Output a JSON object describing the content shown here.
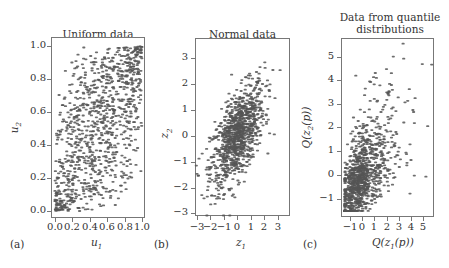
{
  "chart_data": [
    {
      "type": "scatter",
      "panel_tag": "(a)",
      "title": "Uniform data",
      "xlabel": "u1",
      "ylabel": "u2",
      "xlim": [
        0.0,
        1.0
      ],
      "ylim": [
        0.0,
        1.0
      ],
      "xticks": [
        "0.0",
        "0.2",
        "0.4",
        "0.6",
        "0.8",
        "1.0"
      ],
      "yticks": [
        "0.0",
        "0.2",
        "0.4",
        "0.6",
        "0.8",
        "1.0"
      ],
      "grid": false,
      "n_points": 1000,
      "dependence": "positive (Gaussian copula, rho≈0.6), dense in lower-left and upper-right corners",
      "sample_points": [
        [
          0.02,
          0.01
        ],
        [
          0.05,
          0.03
        ],
        [
          0.1,
          0.12
        ],
        [
          0.15,
          0.2
        ],
        [
          0.3,
          0.35
        ],
        [
          0.5,
          0.55
        ],
        [
          0.7,
          0.75
        ],
        [
          0.9,
          0.92
        ],
        [
          0.97,
          0.98
        ],
        [
          0.85,
          0.02
        ],
        [
          0.97,
          0.07
        ],
        [
          0.1,
          0.99
        ],
        [
          0.08,
          0.68
        ],
        [
          0.65,
          0.03
        ],
        [
          0.95,
          0.25
        ]
      ]
    },
    {
      "type": "scatter",
      "panel_tag": "(b)",
      "title": "Normal data",
      "xlabel": "z1",
      "ylabel": "z2",
      "xlim": [
        -3.1,
        3.8
      ],
      "ylim": [
        -3.2,
        3.8
      ],
      "xticks": [
        "-3",
        "-2",
        "-1",
        "0",
        "1",
        "2",
        "3"
      ],
      "yticks": [
        "-3",
        "-2",
        "-1",
        "0",
        "1",
        "2",
        "3"
      ],
      "grid": false,
      "n_points": 1000,
      "dependence": "bivariate normal, rho≈0.6",
      "sample_points": [
        [
          -2.4,
          -2.9
        ],
        [
          -2.9,
          -2.6
        ],
        [
          -0.7,
          3.2
        ],
        [
          -0.4,
          3.1
        ],
        [
          0.5,
          3.4
        ],
        [
          0.9,
          3.5
        ],
        [
          1.5,
          2.8
        ],
        [
          2.5,
          -1.4
        ],
        [
          3.0,
          0.3
        ],
        [
          3.0,
          -0.2
        ],
        [
          3.6,
          1.0
        ],
        [
          2.3,
          2.1
        ],
        [
          1.0,
          -2.3
        ],
        [
          0.0,
          0.0
        ],
        [
          -1.0,
          -1.0
        ],
        [
          1.0,
          1.0
        ]
      ]
    },
    {
      "type": "scatter",
      "panel_tag": "(c)",
      "title": "Data from quantile\ndistributions",
      "xlabel": "Q(z1(p))",
      "ylabel": "Q(z2(p))",
      "xlim": [
        -1.5,
        5.9
      ],
      "ylim": [
        -1.6,
        5.8
      ],
      "xticks": [
        "-1",
        "0",
        "1",
        "2",
        "3",
        "4",
        "5"
      ],
      "yticks": [
        "-1",
        "0",
        "1",
        "2",
        "3",
        "4",
        "5"
      ],
      "grid": false,
      "n_points": 1000,
      "dependence": "right-skewed marginals, positive dependence, dense near (-1,-1)",
      "sample_points": [
        [
          -1.3,
          -1.4
        ],
        [
          -1.0,
          -1.0
        ],
        [
          -0.6,
          4.8
        ],
        [
          -0.3,
          4.6
        ],
        [
          0.6,
          5.2
        ],
        [
          1.0,
          5.5
        ],
        [
          0.7,
          4.2
        ],
        [
          1.1,
          4.2
        ],
        [
          2.0,
          4.2
        ],
        [
          3.7,
          -1.0
        ],
        [
          4.3,
          0.0
        ],
        [
          4.6,
          -0.2
        ],
        [
          5.6,
          1.2
        ],
        [
          5.1,
          1.1
        ],
        [
          1.3,
          -1.4
        ],
        [
          0.0,
          0.0
        ],
        [
          1.0,
          1.0
        ]
      ]
    }
  ],
  "panels": [
    {
      "tag": "(a)",
      "title": "Uniform data",
      "xlabel_main": "u",
      "xlabel_sub": "1",
      "ylabel_main": "u",
      "ylabel_sub": "2",
      "xticks": [
        "0.0",
        "0.2",
        "0.4",
        "0.6",
        "0.8",
        "1.0"
      ],
      "yticks": [
        "1.0",
        "0.8",
        "0.6",
        "0.4",
        "0.2",
        "0.0"
      ]
    },
    {
      "tag": "(b)",
      "title": "Normal data",
      "xlabel_main": "z",
      "xlabel_sub": "1",
      "ylabel_main": "z",
      "ylabel_sub": "2",
      "xticks": [
        "−3",
        "−2",
        "−1",
        "0",
        "1",
        "2",
        "3"
      ],
      "yticks": [
        "3",
        "2",
        "1",
        "0",
        "−1",
        "−2",
        "−3"
      ]
    },
    {
      "tag": "(c)",
      "title": "Data from quantile\ndistributions",
      "xlabel_main": "Q(z",
      "xlabel_sub": "1",
      "xlabel_tail": "(p))",
      "ylabel_main": "Q(z",
      "ylabel_sub": "2",
      "ylabel_tail": "(p))",
      "xticks": [
        "−1",
        "0",
        "1",
        "2",
        "3",
        "4",
        "5"
      ],
      "yticks": [
        "5",
        "4",
        "3",
        "2",
        "1",
        "0",
        "−1"
      ]
    }
  ],
  "colors": {
    "point": "#555555",
    "axis": "#777777",
    "text": "#333333"
  }
}
